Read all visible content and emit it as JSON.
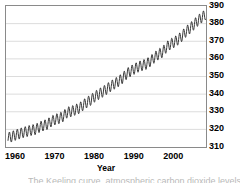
{
  "figure": {
    "background": "#ffffff",
    "frame_color": "#8a8a8a",
    "grid_color": "#dcdcdc",
    "series_color": "#3a3a3a",
    "caption_clipped_text": "The Keeling curve, atmospheric carbon dioxide levels"
  },
  "axes": {
    "x_title": "Year",
    "x_ticks": [
      "1960",
      "1970",
      "1980",
      "1990",
      "2000"
    ],
    "y_ticks": [
      "310",
      "320",
      "330",
      "340",
      "350",
      "360",
      "370",
      "380",
      "390"
    ]
  },
  "chart_data": {
    "type": "line",
    "title": "",
    "subtitle": "",
    "xlabel": "Year",
    "ylabel": "",
    "xlim": [
      1957.5,
      2008.0
    ],
    "ylim": [
      310,
      390
    ],
    "grid": "horizontal",
    "legend": "none",
    "annotations": [],
    "x_tick_values": [
      1960,
      1970,
      1980,
      1990,
      2000
    ],
    "y_tick_values": [
      310,
      320,
      330,
      340,
      350,
      360,
      370,
      380,
      390
    ],
    "series": [
      {
        "name": "Atmospheric CO2 concentration (ppm), monthly mean",
        "description": "Keeling curve: rising trend with seasonal sawtooth oscillation of about 6 ppm peak-to-trough",
        "seasonal_amplitude_ppm": 3.0,
        "seasonal_peak_month": 5,
        "seasonal_trough_month": 10,
        "x": [
          1958,
          1959,
          1960,
          1961,
          1962,
          1963,
          1964,
          1965,
          1966,
          1967,
          1968,
          1969,
          1970,
          1971,
          1972,
          1973,
          1974,
          1975,
          1976,
          1977,
          1978,
          1979,
          1980,
          1981,
          1982,
          1983,
          1984,
          1985,
          1986,
          1987,
          1988,
          1989,
          1990,
          1991,
          1992,
          1993,
          1994,
          1995,
          1996,
          1997,
          1998,
          1999,
          2000,
          2001,
          2002,
          2003,
          2004,
          2005,
          2006,
          2007
        ],
        "values": [
          315.3,
          315.9,
          316.9,
          317.6,
          318.4,
          319.0,
          319.6,
          320.0,
          321.4,
          322.2,
          323.0,
          324.6,
          325.7,
          326.3,
          327.5,
          329.7,
          330.2,
          331.1,
          332.0,
          333.8,
          335.4,
          336.8,
          338.7,
          340.1,
          341.4,
          343.0,
          344.6,
          346.0,
          347.4,
          349.2,
          351.6,
          353.1,
          354.4,
          355.6,
          356.4,
          357.1,
          358.8,
          360.8,
          362.6,
          363.8,
          366.6,
          368.3,
          369.5,
          371.0,
          373.1,
          375.6,
          377.4,
          379.6,
          381.8,
          383.6
        ]
      }
    ]
  }
}
